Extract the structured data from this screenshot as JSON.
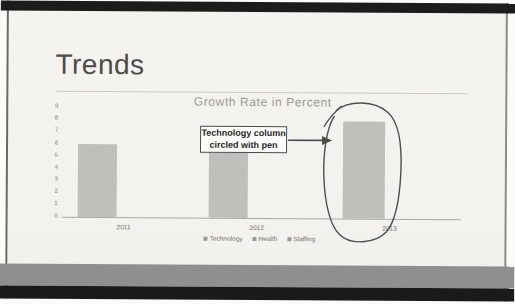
{
  "slide": {
    "title": "Trends"
  },
  "chart_data": {
    "type": "bar",
    "title": "Growth Rate in Percent",
    "categories": [
      "2011",
      "2012",
      "2013"
    ],
    "series": [
      {
        "name": "Technology",
        "values": [
          6,
          6,
          8
        ]
      },
      {
        "name": "Health",
        "values": [
          null,
          null,
          null
        ]
      },
      {
        "name": "Staffing",
        "values": [
          null,
          null,
          null
        ]
      }
    ],
    "xlabel": "",
    "ylabel": "",
    "ylim": [
      0,
      9
    ],
    "yticks": [
      "0",
      "1",
      "2",
      "3",
      "4",
      "5",
      "6",
      "7",
      "8",
      "9"
    ],
    "legend": [
      "Technology",
      "Health",
      "Staffing"
    ],
    "legend_position": "bottom",
    "grid": false
  },
  "annotation": {
    "callout_line1": "Technology column",
    "callout_line2": "circled with pen",
    "target": "2013 Technology bar"
  },
  "colors": {
    "slide_background": "#f3f2ee",
    "bar": "#c0bfbc",
    "band_gray": "#8f8f8f",
    "band_black": "#1a1a1a",
    "pen_ink": "#4f4f4f",
    "title_text": "#4b4b4b",
    "chart_text": "#9a9896"
  }
}
